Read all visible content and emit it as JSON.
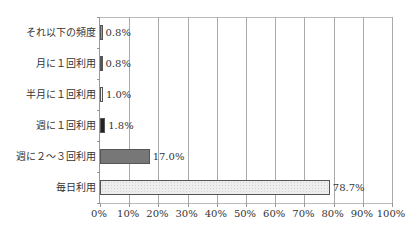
{
  "chart_data": {
    "type": "bar",
    "orientation": "horizontal",
    "title": "",
    "xlabel": "",
    "ylabel": "",
    "xlim": [
      0,
      100
    ],
    "grid": true,
    "legend": null,
    "categories": [
      "それ以下の頻度",
      "月に１回利用",
      "半月に１回利用",
      "週に１回利用",
      "週に２～３回利用",
      "毎日利用"
    ],
    "values": [
      0.8,
      0.8,
      1.0,
      1.8,
      17.0,
      78.7
    ],
    "value_labels": [
      "0.8%",
      "0.8%",
      "1.0%",
      "1.8%",
      "17.0%",
      "78.7%"
    ],
    "bar_colors": [
      "#9a9a9a",
      "#555555",
      "#f2f2f2",
      "#222222",
      "#777777",
      "#eeeeee"
    ],
    "x_tick_labels": [
      "0%",
      "10%",
      "20%",
      "30%",
      "40%",
      "50%",
      "60%",
      "70%",
      "80%",
      "90%",
      "100%"
    ]
  }
}
